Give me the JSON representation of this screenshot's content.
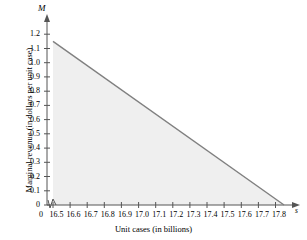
{
  "chart_data": {
    "type": "line",
    "title": "",
    "xlabel": "Unit cases (in billions)",
    "ylabel": "Marginal revenue (in dollars per unit case)",
    "x_axis_symbol": "s",
    "y_axis_symbol": "M",
    "xlim": [
      16.5,
      17.9
    ],
    "ylim": [
      0,
      1.25
    ],
    "x_origin_label": "0",
    "axis_break": true,
    "grid": false,
    "legend": null,
    "x_ticks": [
      "16.5",
      "16.6",
      "16.7",
      "16.8",
      "16.9",
      "17.0",
      "17.1",
      "17.2",
      "17.3",
      "17.4",
      "17.5",
      "17.6",
      "17.7",
      "17.8"
    ],
    "x_tick_values": [
      16.5,
      16.6,
      16.7,
      16.8,
      16.9,
      17.0,
      17.1,
      17.2,
      17.3,
      17.4,
      17.5,
      17.6,
      17.7,
      17.8
    ],
    "y_ticks": [
      "0",
      "0.1",
      "0.2",
      "0.3",
      "0.4",
      "0.5",
      "0.6",
      "0.7",
      "0.8",
      "0.9",
      "1.0",
      "1.1",
      "1.2"
    ],
    "y_tick_values": [
      0,
      0.1,
      0.2,
      0.3,
      0.4,
      0.5,
      0.6,
      0.7,
      0.8,
      0.9,
      1.0,
      1.1,
      1.2
    ],
    "series": [
      {
        "name": "Marginal revenue",
        "color": "#808080",
        "x": [
          16.5,
          17.85
        ],
        "values": [
          1.15,
          0.0
        ]
      }
    ],
    "shaded_region": {
      "fill_color": "#efefef",
      "x": [
        16.5,
        17.85
      ],
      "y_top": [
        1.15,
        0.0
      ],
      "y_bottom": [
        0.0,
        0.0
      ]
    }
  }
}
